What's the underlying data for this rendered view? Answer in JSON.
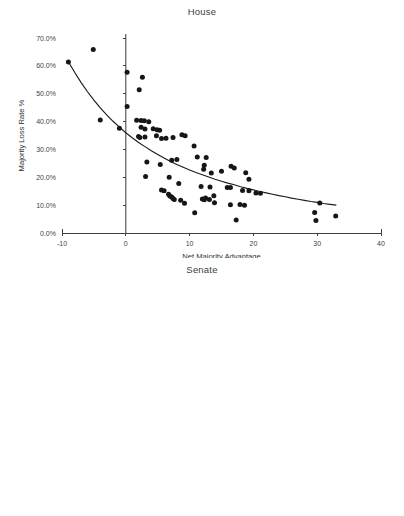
{
  "figure": {
    "background": "#ffffff",
    "marker_color": "#161616",
    "axis_color": "#3f3f3f"
  },
  "panels": [
    {
      "id": "house",
      "title": "House",
      "xlabel": "Net Majority Advantage",
      "ylabel": "Majority Loss Rate %"
    },
    {
      "id": "senate",
      "title": "Senate",
      "xlabel": "Net Majority Advantage",
      "ylabel": "Majority Party Loss Rate"
    }
  ],
  "chart_data": [
    {
      "type": "scatter",
      "title": "House",
      "xlabel": "Net Majority Advantage",
      "ylabel": "Majority Loss Rate %",
      "xlim": [
        -10,
        40
      ],
      "ylim": [
        0,
        70
      ],
      "xticks": [
        -10,
        0,
        10,
        20,
        30,
        40
      ],
      "xticklabels": [
        "-10",
        "0",
        "10",
        "20",
        "30",
        "40"
      ],
      "yticks": [
        0,
        10,
        20,
        30,
        40,
        50,
        60,
        70
      ],
      "yticklabels": [
        "0.0%",
        "10.0%",
        "20.0%",
        "30.0%",
        "40.0%",
        "50.0%",
        "60.0%",
        "70.0%"
      ],
      "grid": false,
      "legend": "none",
      "marker": "circle",
      "zero_line": true,
      "fit": {
        "kind": "power-decay-curve",
        "points": [
          [
            -9.0,
            61.5
          ],
          [
            -8.0,
            57.6
          ],
          [
            -7.0,
            54.0
          ],
          [
            -6.0,
            50.7
          ],
          [
            -5.0,
            47.7
          ],
          [
            -4.0,
            44.9
          ],
          [
            -3.0,
            42.4
          ],
          [
            -2.0,
            40.1
          ],
          [
            -1.0,
            38.0
          ],
          [
            0.0,
            36.0
          ],
          [
            1.0,
            34.2
          ],
          [
            2.0,
            32.5
          ],
          [
            3.0,
            31.0
          ],
          [
            4.0,
            29.5
          ],
          [
            5.0,
            28.2
          ],
          [
            6.0,
            26.9
          ],
          [
            7.0,
            25.7
          ],
          [
            8.0,
            24.6
          ],
          [
            9.0,
            23.6
          ],
          [
            10.0,
            22.6
          ],
          [
            11.0,
            21.7
          ],
          [
            12.0,
            20.9
          ],
          [
            13.0,
            20.1
          ],
          [
            14.0,
            19.3
          ],
          [
            15.0,
            18.6
          ],
          [
            16.0,
            17.9
          ],
          [
            17.0,
            17.3
          ],
          [
            18.0,
            16.6
          ],
          [
            19.0,
            16.0
          ],
          [
            20.0,
            15.5
          ],
          [
            21.0,
            14.9
          ],
          [
            22.0,
            14.4
          ],
          [
            23.0,
            13.9
          ],
          [
            24.0,
            13.4
          ],
          [
            25.0,
            13.0
          ],
          [
            26.0,
            12.5
          ],
          [
            27.0,
            12.1
          ],
          [
            28.0,
            11.7
          ],
          [
            29.0,
            11.3
          ],
          [
            30.0,
            11.0
          ],
          [
            31.0,
            10.6
          ],
          [
            32.0,
            10.3
          ],
          [
            33.0,
            10.0
          ]
        ]
      },
      "points": [
        [
          -9.0,
          61.4
        ],
        [
          -5.1,
          65.9
        ],
        [
          -4.0,
          40.6
        ],
        [
          -1.0,
          37.6
        ],
        [
          0.2,
          57.7
        ],
        [
          0.2,
          45.4
        ],
        [
          2.6,
          55.9
        ],
        [
          2.1,
          51.4
        ],
        [
          1.7,
          40.5
        ],
        [
          2.4,
          40.4
        ],
        [
          2.9,
          40.3
        ],
        [
          3.6,
          39.9
        ],
        [
          2.4,
          38.0
        ],
        [
          3.0,
          37.3
        ],
        [
          4.3,
          37.4
        ],
        [
          4.9,
          37.1
        ],
        [
          5.3,
          36.9
        ],
        [
          2.0,
          34.6
        ],
        [
          2.2,
          34.3
        ],
        [
          3.0,
          34.5
        ],
        [
          4.8,
          34.9
        ],
        [
          5.6,
          33.9
        ],
        [
          6.3,
          34.0
        ],
        [
          7.4,
          34.3
        ],
        [
          8.8,
          35.3
        ],
        [
          9.3,
          34.9
        ],
        [
          10.7,
          31.2
        ],
        [
          3.3,
          25.5
        ],
        [
          5.4,
          24.6
        ],
        [
          7.2,
          26.1
        ],
        [
          8.0,
          26.4
        ],
        [
          11.2,
          27.3
        ],
        [
          12.6,
          27.1
        ],
        [
          12.3,
          24.3
        ],
        [
          12.2,
          22.9
        ],
        [
          13.4,
          21.5
        ],
        [
          15.0,
          22.2
        ],
        [
          16.5,
          24.0
        ],
        [
          17.0,
          23.3
        ],
        [
          18.8,
          21.6
        ],
        [
          19.3,
          19.3
        ],
        [
          3.1,
          20.3
        ],
        [
          6.8,
          20.0
        ],
        [
          8.3,
          17.8
        ],
        [
          11.8,
          16.7
        ],
        [
          13.2,
          16.5
        ],
        [
          15.9,
          16.3
        ],
        [
          16.4,
          16.3
        ],
        [
          18.3,
          15.3
        ],
        [
          19.3,
          15.2
        ],
        [
          20.4,
          14.4
        ],
        [
          21.1,
          14.3
        ],
        [
          5.6,
          15.4
        ],
        [
          6.0,
          15.2
        ],
        [
          6.7,
          13.9
        ],
        [
          6.9,
          13.3
        ],
        [
          7.2,
          12.9
        ],
        [
          7.4,
          12.4
        ],
        [
          7.6,
          12.0
        ],
        [
          8.6,
          11.8
        ],
        [
          9.2,
          10.7
        ],
        [
          12.0,
          12.2
        ],
        [
          12.3,
          11.9
        ],
        [
          12.5,
          12.6
        ],
        [
          13.1,
          12.0
        ],
        [
          13.9,
          10.9
        ],
        [
          13.8,
          13.4
        ],
        [
          16.4,
          10.1
        ],
        [
          17.9,
          10.2
        ],
        [
          18.6,
          10.0
        ],
        [
          10.8,
          7.3
        ],
        [
          17.3,
          4.7
        ],
        [
          29.6,
          7.4
        ],
        [
          30.4,
          10.8
        ],
        [
          29.8,
          4.5
        ],
        [
          32.9,
          6.1
        ]
      ]
    },
    {
      "type": "scatter",
      "title": "Senate",
      "xlabel": "Net Majority Advantage",
      "ylabel": "Majority Party Loss Rate",
      "xlim": [
        -10,
        40
      ],
      "ylim": [
        0,
        70
      ],
      "xticks": [
        -10,
        -5,
        0,
        5,
        10,
        15,
        20,
        25,
        30,
        35,
        40
      ],
      "xticklabels": [
        "-10",
        "-5",
        "0",
        "5",
        "10",
        "15",
        "20",
        "25",
        "30",
        "35",
        "40"
      ],
      "yticks": [
        0,
        10,
        20,
        30,
        40,
        50,
        60,
        70
      ],
      "yticklabels": [
        "0.0%",
        "10.0%",
        "20.0%",
        "30.0%",
        "40.0%",
        "50.0%",
        "60.0%",
        "70.0%"
      ],
      "grid": false,
      "legend": "none",
      "marker": "triangle",
      "zero_line": true,
      "fit": {
        "kind": "linear",
        "points": [
          [
            -8.0,
            55.8
          ],
          [
            22.0,
            6.3
          ]
        ]
      },
      "points": [
        [
          -8.0,
          55.8
        ],
        [
          -2.5,
          64.3
        ],
        [
          -2.4,
          22.3
        ],
        [
          -1.4,
          50.1
        ],
        [
          -1.0,
          47.2
        ],
        [
          -0.2,
          53.0
        ],
        [
          0.2,
          50.2
        ],
        [
          0.7,
          55.3
        ],
        [
          0.2,
          40.9
        ],
        [
          0.5,
          40.3
        ],
        [
          0.8,
          40.2
        ],
        [
          0.3,
          39.7
        ],
        [
          -1.2,
          41.0
        ],
        [
          3.0,
          50.3
        ],
        [
          3.6,
          44.6
        ],
        [
          3.4,
          38.6
        ],
        [
          3.0,
          31.3
        ],
        [
          2.5,
          28.4
        ],
        [
          2.9,
          15.8
        ],
        [
          2.1,
          21.8
        ],
        [
          4.5,
          40.3
        ],
        [
          5.1,
          40.1
        ],
        [
          5.6,
          39.6
        ],
        [
          5.8,
          38.7
        ],
        [
          4.6,
          35.9
        ],
        [
          5.0,
          28.9
        ],
        [
          5.5,
          31.2
        ],
        [
          6.0,
          26.1
        ],
        [
          6.3,
          25.9
        ],
        [
          4.3,
          21.7
        ],
        [
          4.6,
          15.6
        ],
        [
          6.3,
          35.1
        ],
        [
          7.6,
          38.3
        ],
        [
          7.9,
          26.7
        ],
        [
          8.0,
          15.9
        ],
        [
          8.6,
          15.9
        ],
        [
          8.4,
          32.8
        ],
        [
          9.0,
          33.1
        ],
        [
          9.4,
          17.9
        ],
        [
          9.9,
          15.9
        ],
        [
          10.2,
          35.1
        ],
        [
          10.5,
          32.6
        ],
        [
          10.8,
          29.8
        ],
        [
          10.6,
          21.7
        ],
        [
          11.4,
          28.9
        ],
        [
          11.3,
          25.9
        ],
        [
          12.0,
          25.8
        ],
        [
          12.4,
          25.4
        ],
        [
          12.6,
          29.2
        ],
        [
          13.0,
          26.2
        ],
        [
          13.3,
          26.7
        ],
        [
          12.9,
          19.3
        ],
        [
          13.5,
          7.1
        ],
        [
          14.3,
          17.7
        ],
        [
          15.0,
          23.2
        ],
        [
          15.1,
          6.7
        ],
        [
          16.0,
          22.1
        ],
        [
          16.2,
          17.4
        ],
        [
          16.6,
          17.7
        ],
        [
          16.9,
          16.6
        ],
        [
          16.2,
          8.7
        ],
        [
          17.5,
          17.7
        ],
        [
          17.6,
          13.2
        ],
        [
          17.9,
          8.6
        ],
        [
          18.3,
          9.5
        ],
        [
          18.6,
          8.9
        ],
        [
          18.2,
          11.8
        ],
        [
          19.0,
          9.4
        ],
        [
          19.4,
          7.9
        ],
        [
          20.2,
          7.3
        ],
        [
          20.8,
          6.2
        ],
        [
          22.0,
          14.7
        ]
      ]
    }
  ]
}
